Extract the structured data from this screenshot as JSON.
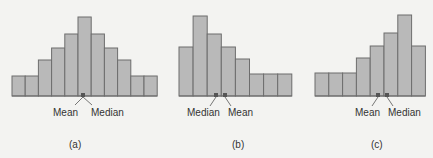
{
  "chart_data": [
    {
      "type": "bar",
      "title": "(a)",
      "description": "Symmetric histogram",
      "values": [
        20,
        20,
        36,
        48,
        62,
        79,
        62,
        48,
        36,
        20,
        20
      ],
      "markers": [
        {
          "label": "Mean",
          "position": 5.5
        },
        {
          "label": "Median",
          "position": 5.5
        }
      ],
      "xlabel": "",
      "ylabel": "",
      "grid": false
    },
    {
      "type": "bar",
      "title": "(b)",
      "description": "Right-skewed histogram",
      "values": [
        49,
        80,
        62,
        49,
        37,
        22,
        22,
        22
      ],
      "markers": [
        {
          "label": "Median",
          "position": 2.6
        },
        {
          "label": "Mean",
          "position": 3.2
        }
      ],
      "xlabel": "",
      "ylabel": "",
      "grid": false
    },
    {
      "type": "bar",
      "title": "(c)",
      "description": "Left-skewed histogram",
      "values": [
        23,
        23,
        23,
        38,
        50,
        63,
        81,
        50
      ],
      "markers": [
        {
          "label": "Mean",
          "position": 4.5
        },
        {
          "label": "Median",
          "position": 5.1
        }
      ],
      "xlabel": "",
      "ylabel": "",
      "grid": false
    }
  ],
  "labels": {
    "a_mean": "Mean",
    "a_median": "Median",
    "a_caption": "(a)",
    "b_median": "Median",
    "b_mean": "Mean",
    "b_caption": "(b)",
    "c_mean": "Mean",
    "c_median": "Median",
    "c_caption": "(c)"
  },
  "colors": {
    "bar_fill": "#b9b9b9",
    "bar_stroke": "#6d6d6d",
    "background": "#f3f3f1"
  }
}
